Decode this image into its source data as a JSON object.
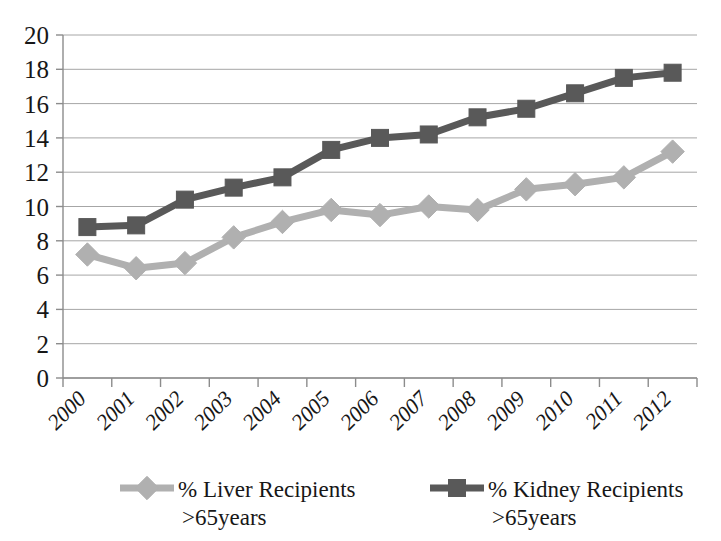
{
  "chart_data": {
    "type": "line",
    "title": "",
    "subtitle": "",
    "xlabel": "",
    "ylabel": "",
    "categories": [
      "2000",
      "2001",
      "2002",
      "2003",
      "2004",
      "2005",
      "2006",
      "2007",
      "2008",
      "2009",
      "2010",
      "2011",
      "2012"
    ],
    "series": [
      {
        "name": "% Liver Recipients >65years",
        "legend_line1": "% Liver Recipients",
        "legend_line2": ">65years",
        "marker": "diamond",
        "color": "#b0b0b0",
        "values": [
          7.2,
          6.4,
          6.7,
          8.2,
          9.1,
          9.8,
          9.5,
          10.0,
          9.8,
          11.0,
          11.3,
          11.7,
          13.2
        ]
      },
      {
        "name": "% Kidney Recipients >65years",
        "legend_line1": "% Kidney Recipients",
        "legend_line2": ">65years",
        "marker": "square",
        "color": "#595959",
        "values": [
          8.8,
          8.9,
          10.4,
          11.1,
          11.7,
          13.3,
          14.0,
          14.2,
          15.2,
          15.7,
          16.6,
          17.5,
          17.8
        ]
      }
    ],
    "ylim": [
      0,
      20
    ],
    "yticks": [
      0,
      2,
      4,
      6,
      8,
      10,
      12,
      14,
      16,
      18,
      20
    ],
    "ytick_labels": [
      "0",
      "2",
      "4",
      "6",
      "8",
      "10",
      "12",
      "14",
      "16",
      "18",
      "20"
    ],
    "grid": true,
    "grid_axis": "y",
    "legend_position": "bottom",
    "xtick_rotation": 45
  },
  "colors": {
    "liver": "#b0b0b0",
    "kidney": "#595959",
    "gridline": "#a6a6a6",
    "axis": "#8c8c8c",
    "text": "#171717",
    "background": "#ffffff"
  }
}
